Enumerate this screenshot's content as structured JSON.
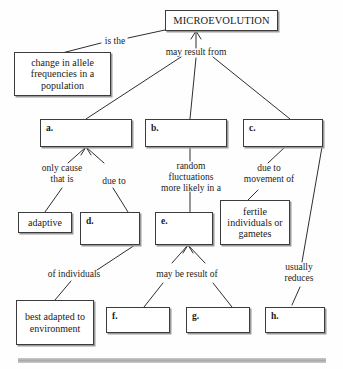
{
  "diagram": {
    "nodes": [
      {
        "id": "microevolution",
        "label": "MICROEVOLUTION",
        "blank": ""
      },
      {
        "id": "allele-change",
        "label": "change in allele\nfrequencies in a\npopulation",
        "blank": ""
      },
      {
        "id": "box-a",
        "label": "",
        "blank": "a."
      },
      {
        "id": "box-b",
        "label": "",
        "blank": "b."
      },
      {
        "id": "box-c",
        "label": "",
        "blank": "c."
      },
      {
        "id": "adaptive",
        "label": "adaptive",
        "blank": ""
      },
      {
        "id": "box-d",
        "label": "",
        "blank": "d."
      },
      {
        "id": "box-e",
        "label": "",
        "blank": "e."
      },
      {
        "id": "fertile",
        "label": "fertile\nindividuals\nor gametes",
        "blank": ""
      },
      {
        "id": "best-adapted",
        "label": "best adapted\nto\nenvironment",
        "blank": ""
      },
      {
        "id": "box-f",
        "label": "",
        "blank": "f."
      },
      {
        "id": "box-g",
        "label": "",
        "blank": "g."
      },
      {
        "id": "box-h",
        "label": "",
        "blank": "h."
      }
    ],
    "edge_labels": [
      {
        "id": "is-the",
        "text": "is the"
      },
      {
        "id": "may-result-from",
        "text": "may result from"
      },
      {
        "id": "only-cause-that-is",
        "text": "only cause\nthat is"
      },
      {
        "id": "due-to",
        "text": "due to"
      },
      {
        "id": "random-fluctuations",
        "text": "random\nfluctuations\nmore likely in a"
      },
      {
        "id": "due-to-movement-of",
        "text": "due to\nmovement of"
      },
      {
        "id": "of-individuals",
        "text": "of individuals"
      },
      {
        "id": "may-be-result-of",
        "text": "may be result of"
      },
      {
        "id": "usually-reduces",
        "text": "usually\nreduces"
      }
    ],
    "colors": {
      "line": "#2e2e2e",
      "box_border": "#3c3c3c",
      "box_shadow": "#9a9a9a",
      "text": "#1a1a1a",
      "background": "#fefefe",
      "rule": "#a8a8a8"
    }
  }
}
